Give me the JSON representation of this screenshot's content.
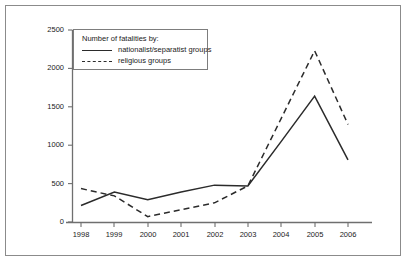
{
  "chart_data": {
    "type": "line",
    "title": "",
    "xlabel": "",
    "ylabel": "",
    "categories": [
      "1998",
      "1999",
      "2000",
      "2001",
      "2002",
      "2003",
      "2004",
      "2005",
      "2006"
    ],
    "x": [
      1998,
      1999,
      2000,
      2001,
      2002,
      2003,
      2004,
      2005,
      2006
    ],
    "ylim": [
      0,
      2500
    ],
    "yticks": [
      0,
      500,
      1000,
      1500,
      2000,
      2500
    ],
    "ytick_labels": [
      "0",
      "500",
      "1000",
      "1500",
      "2000",
      "2500"
    ],
    "grid": false,
    "legend_position": "upper-left",
    "legend_title": "Number of fatalities by:",
    "series": [
      {
        "name": "nationalist/separatist groups",
        "style": "solid",
        "color": "#2b2b2b",
        "values": [
          215,
          390,
          290,
          390,
          480,
          470,
          1050,
          1640,
          810
        ]
      },
      {
        "name": "religious groups",
        "style": "dashed",
        "color": "#2b2b2b",
        "values": [
          435,
          340,
          70,
          160,
          250,
          470,
          1350,
          2230,
          1270
        ]
      }
    ]
  },
  "axes": {
    "y_tick_labels": [
      "2500",
      "2000",
      "1500",
      "1000",
      "500",
      "0"
    ],
    "x_tick_labels": [
      "1998",
      "1999",
      "2000",
      "2001",
      "2002",
      "2003",
      "2004",
      "2005",
      "2006"
    ]
  },
  "legend": {
    "title": "Number of fatalities by:",
    "entries": [
      {
        "label": "nationalist/separatist groups",
        "style": "solid"
      },
      {
        "label": "religious groups",
        "style": "dashed"
      }
    ]
  },
  "colors": {
    "line": "#2b2b2b",
    "axis": "#6f6f6f",
    "frame": "#8b8b8b",
    "text": "#1a1a1a",
    "background": "#ffffff"
  }
}
